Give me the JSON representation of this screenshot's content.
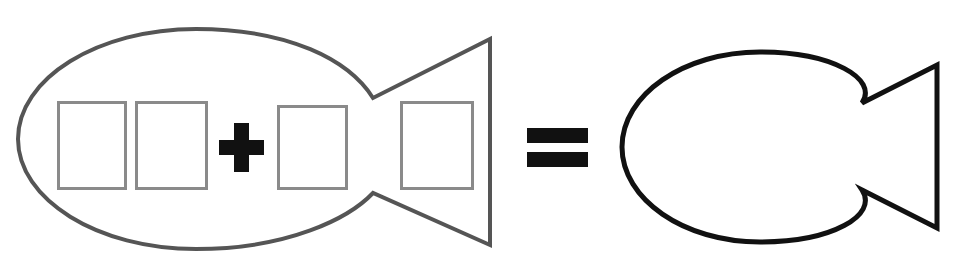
{
  "figure": {
    "kind": "pictorial-equation",
    "description": "Fish outline containing four empty rectangles plus a plus sign equals a plain fish outline",
    "background_color": "#ffffff",
    "equation_text": "fish-with-four-boxes + = fish",
    "operators": [
      {
        "name": "plus-sign",
        "glyph": "+",
        "color": "#111111",
        "x": 219,
        "y": 123,
        "width": 45,
        "height": 49,
        "bar_thickness": 15
      },
      {
        "name": "equals-sign",
        "glyph": "=",
        "color": "#111111",
        "x": 527,
        "y": 128,
        "width": 61,
        "height": 38,
        "bar_thickness": 15,
        "bar_gap": 9
      }
    ],
    "shapes": [
      {
        "name": "left-fish",
        "label": "fish-with-boxes",
        "stroke_color": "#555555",
        "stroke_width": 4,
        "fill": "none",
        "body": {
          "cx": 196,
          "cy": 139,
          "rx": 178,
          "ry": 110
        },
        "tail": {
          "notch_x": 373,
          "notch_top_y": 98,
          "notch_bottom_y": 193,
          "back_x": 490,
          "back_top_y": 39,
          "back_bottom_y": 245
        }
      },
      {
        "name": "right-fish",
        "label": "plain-fish",
        "stroke_color": "#111111",
        "stroke_width": 5,
        "fill": "none",
        "body": {
          "cx": 760,
          "cy": 147,
          "rx": 138,
          "ry": 95
        },
        "tail": {
          "notch_x": 862,
          "notch_top_y": 103,
          "notch_bottom_y": 190,
          "back_x": 937,
          "back_top_y": 65,
          "back_bottom_y": 228
        }
      }
    ],
    "boxes": {
      "stroke_color": "#8a8a8a",
      "stroke_width": 3,
      "fill": "none",
      "count": 4,
      "items": [
        {
          "name": "box-1",
          "x": 57,
          "y": 101,
          "width": 70,
          "height": 89
        },
        {
          "name": "box-2",
          "x": 135,
          "y": 101,
          "width": 73,
          "height": 89
        },
        {
          "name": "box-3",
          "x": 277,
          "y": 105,
          "width": 71,
          "height": 85
        },
        {
          "name": "box-4",
          "x": 400,
          "y": 101,
          "width": 74,
          "height": 89
        }
      ]
    }
  }
}
